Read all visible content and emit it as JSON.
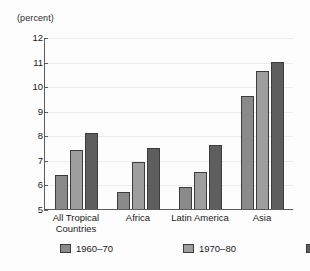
{
  "chart_data": {
    "type": "bar",
    "title": "",
    "subtitle": "",
    "unit_label": "(percent)",
    "xlabel": "",
    "ylabel": "",
    "ylim": [
      5,
      12
    ],
    "yticks": [
      12,
      11,
      10,
      9,
      8,
      7,
      6,
      5
    ],
    "ytick_labels": [
      "12",
      "11",
      "10",
      "9",
      "8",
      "7",
      "6",
      "5"
    ],
    "grid": true,
    "legend_position": "bottom",
    "categories": [
      "All Tropical\nCountries",
      "Africa",
      "Latin America",
      "Asia"
    ],
    "series": [
      {
        "name": "1960–70",
        "color": "#8a8a8a",
        "values": [
          6.4,
          5.7,
          5.9,
          9.6
        ]
      },
      {
        "name": "1970–80",
        "color": "#9e9e9e",
        "values": [
          7.4,
          6.9,
          6.5,
          10.6
        ]
      },
      {
        "name": "1980–90",
        "color": "#5e5e5e",
        "values": [
          8.1,
          7.5,
          7.6,
          11.0
        ]
      }
    ]
  },
  "caption": {
    "text": ""
  }
}
